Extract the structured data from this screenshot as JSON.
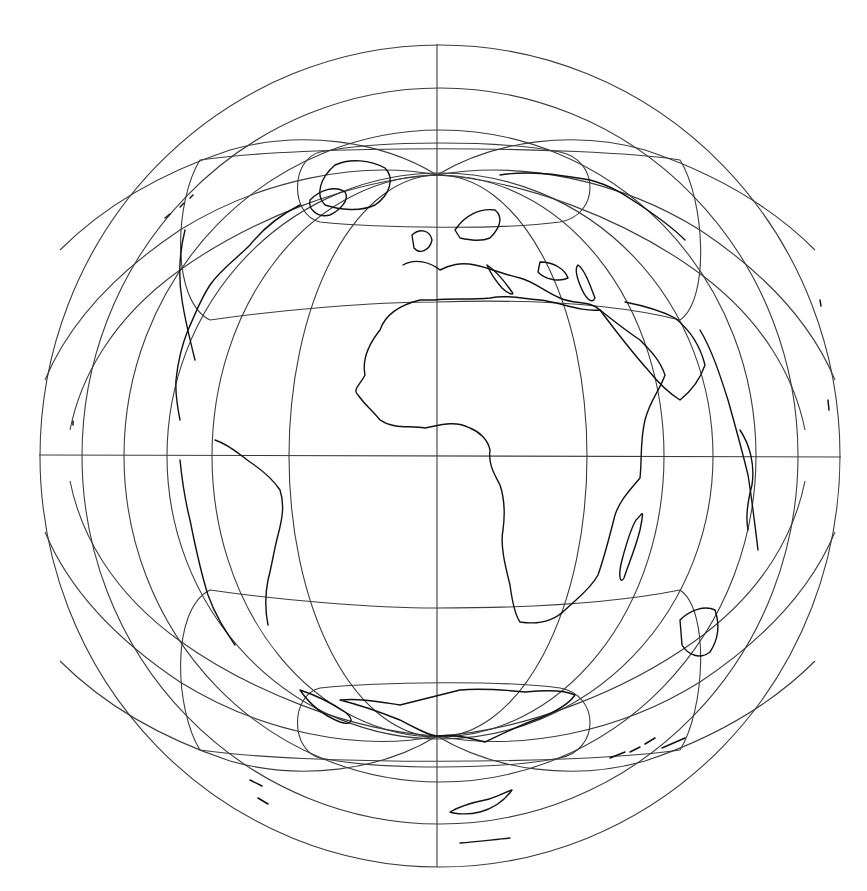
{
  "map": {
    "projection_type": "azimuthal world map centered on Africa / Atlantic",
    "colors": {
      "background": "#ffffff",
      "graticule": "#3a3a3a",
      "coastline": "#111111"
    },
    "center": {
      "x": 439,
      "y": 456
    },
    "north_pole": {
      "x": 437,
      "y": 175
    },
    "south_pole": {
      "x": 437,
      "y": 736
    },
    "outer_circles_radii": [
      400,
      358,
      316,
      273
    ],
    "meridian_half_widths": [
      149,
      226
    ],
    "regions_visible": [
      "North America",
      "Greenland",
      "Europe",
      "Africa",
      "South America",
      "Antarctica",
      "Arabia",
      "Madagascar"
    ]
  }
}
